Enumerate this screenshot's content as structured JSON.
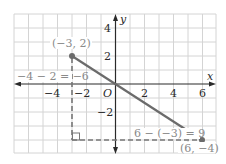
{
  "diagram": {
    "type": "coordinate-plane-distance",
    "axes": {
      "x_label": "x",
      "y_label": "y",
      "origin_label": "O",
      "x_ticks": [
        {
          "value": -4,
          "label": "−4"
        },
        {
          "value": -2,
          "label": "−2"
        },
        {
          "value": 2,
          "label": "2"
        },
        {
          "value": 4,
          "label": "4"
        },
        {
          "value": 6,
          "label": "6"
        }
      ],
      "y_ticks": [
        {
          "value": 4,
          "label": "4"
        },
        {
          "value": 2,
          "label": "2"
        },
        {
          "value": -2,
          "label": "−2"
        }
      ],
      "x_range": [
        -7,
        7
      ],
      "y_range": [
        -5,
        5
      ],
      "grid": true
    },
    "points": [
      {
        "x": -3,
        "y": 2,
        "label": "(−3, 2)"
      },
      {
        "x": 6,
        "y": -4,
        "label": "(6, −4)"
      }
    ],
    "segment": {
      "from": [
        -3,
        2
      ],
      "to": [
        6,
        -4
      ]
    },
    "right_triangle_corner": [
      -3,
      -4
    ],
    "annotations": {
      "vertical_leg": "−4 − 2 = −6",
      "horizontal_leg": "6 − (−3) = 9"
    },
    "colors": {
      "grid": "#d4d4d4",
      "axis": "#2a2a2a",
      "segment": "#6b6b6b",
      "dashed": "#777777",
      "text": "#2a2a2a",
      "label_gray": "#8a8a8a"
    }
  }
}
